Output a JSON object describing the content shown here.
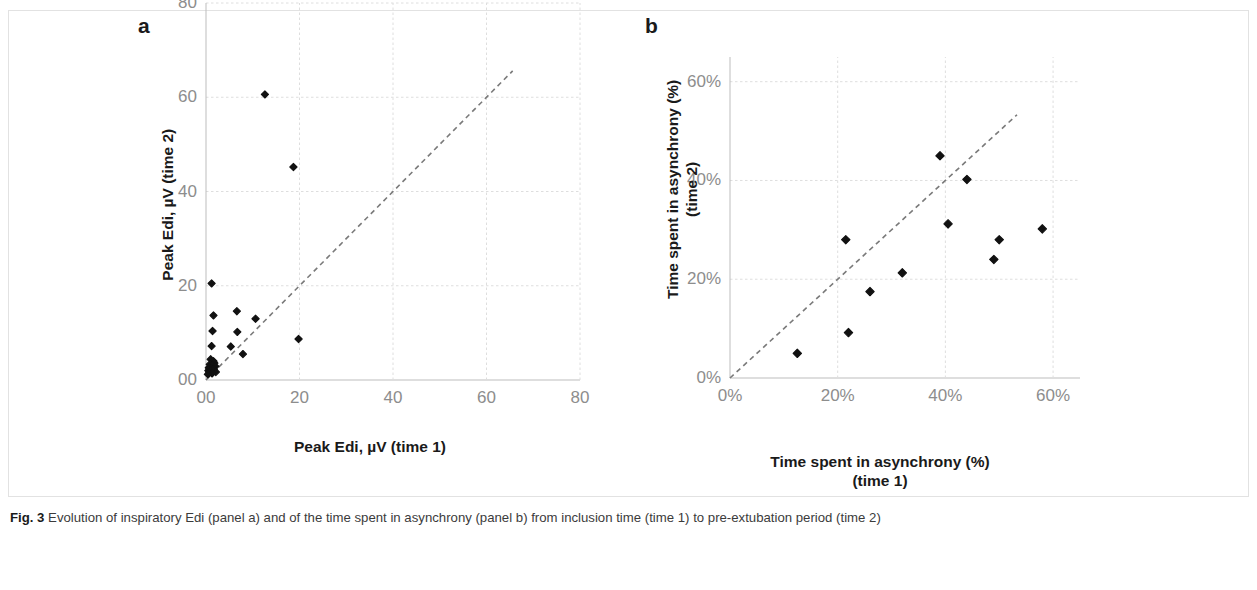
{
  "figure": {
    "caption_label": "Fig. 3",
    "caption_text": "Evolution of inspiratory Edi (panel a) and of the time spent in asynchrony (panel b) from inclusion time (time 1) to pre-extubation period (time 2)"
  },
  "panels": {
    "a": {
      "letter": "a",
      "xlabel": "Peak Edi, µV (time 1)",
      "ylabel": "Peak Edi, µV  (time 2)",
      "xticks": [
        "00",
        "20",
        "40",
        "60",
        "80"
      ],
      "yticks": [
        "00",
        "20",
        "40",
        "60",
        "80"
      ]
    },
    "b": {
      "letter": "b",
      "xlabel": "Time spent in asynchrony (%)\n(time 1)",
      "ylabel": "Time spent in asynchrony (%)\n(time 2)",
      "xticks": [
        "0%",
        "20%",
        "40%",
        "60%"
      ],
      "yticks": [
        "0%",
        "20%",
        "40%",
        "60%"
      ]
    }
  },
  "colors": {
    "marker": "#111111",
    "identity_line": "#7a7a7a",
    "gridline": "#dedede",
    "axis": "#bdbdbd",
    "tick_text": "#8d8d8d",
    "label_text": "#1a1a1a",
    "caption_text": "#3b3b3b",
    "background": "#ffffff"
  },
  "chart_data": [
    {
      "type": "scatter",
      "panel": "a",
      "title": "Evolution of inspiratory Edi",
      "xlabel": "Peak Edi, µV (time 1)",
      "ylabel": "Peak Edi, µV (time 2)",
      "xlim": [
        0,
        80
      ],
      "ylim": [
        0,
        80
      ],
      "xticks": [
        0,
        20,
        40,
        60,
        80
      ],
      "yticks": [
        0,
        20,
        40,
        60,
        80
      ],
      "xtick_labels": [
        "00",
        "20",
        "40",
        "60",
        "80"
      ],
      "ytick_labels": [
        "00",
        "20",
        "40",
        "60",
        "80"
      ],
      "grid": true,
      "legend": "none",
      "annotations": [
        "dashed identity line y = x"
      ],
      "series": [
        {
          "name": "patients",
          "marker": "diamond",
          "points": [
            [
              12.6,
              60.6
            ],
            [
              18.7,
              45.2
            ],
            [
              1.2,
              20.5
            ],
            [
              6.6,
              14.6
            ],
            [
              1.6,
              13.7
            ],
            [
              10.6,
              13.0
            ],
            [
              1.4,
              10.4
            ],
            [
              6.7,
              10.2
            ],
            [
              1.2,
              7.2
            ],
            [
              5.3,
              7.1
            ],
            [
              7.9,
              5.5
            ],
            [
              19.8,
              8.7
            ],
            [
              1.0,
              4.4
            ],
            [
              1.6,
              4.0
            ],
            [
              1.8,
              3.6
            ],
            [
              0.8,
              3.3
            ],
            [
              1.3,
              3.0
            ],
            [
              2.0,
              2.9
            ],
            [
              0.6,
              2.6
            ],
            [
              1.1,
              2.4
            ],
            [
              1.7,
              2.3
            ],
            [
              0.5,
              2.0
            ],
            [
              1.0,
              1.9
            ],
            [
              1.5,
              1.8
            ],
            [
              2.1,
              1.7
            ],
            [
              0.7,
              1.5
            ],
            [
              1.3,
              1.4
            ],
            [
              0.4,
              1.2
            ]
          ]
        }
      ]
    },
    {
      "type": "scatter",
      "panel": "b",
      "title": "Evolution of the time spent in asynchrony",
      "xlabel": "Time spent in asynchrony (%) (time 1)",
      "ylabel": "Time spent in asynchrony (%) (time 2)",
      "xlim": [
        0,
        65
      ],
      "ylim": [
        0,
        65
      ],
      "xticks": [
        0,
        20,
        40,
        60
      ],
      "yticks": [
        0,
        20,
        40,
        60
      ],
      "xtick_labels": [
        "0%",
        "20%",
        "40%",
        "60%"
      ],
      "ytick_labels": [
        "0%",
        "20%",
        "40%",
        "60%"
      ],
      "grid": true,
      "legend": "none",
      "annotations": [
        "dashed identity line y = x"
      ],
      "series": [
        {
          "name": "patients",
          "marker": "diamond",
          "points": [
            [
              12.5,
              5.0
            ],
            [
              22.0,
              9.2
            ],
            [
              21.5,
              28.0
            ],
            [
              26.0,
              17.5
            ],
            [
              32.0,
              21.3
            ],
            [
              39.0,
              45.0
            ],
            [
              40.5,
              31.2
            ],
            [
              44.0,
              40.2
            ],
            [
              49.0,
              24.0
            ],
            [
              50.0,
              28.0
            ],
            [
              58.0,
              30.2
            ]
          ]
        }
      ]
    }
  ]
}
